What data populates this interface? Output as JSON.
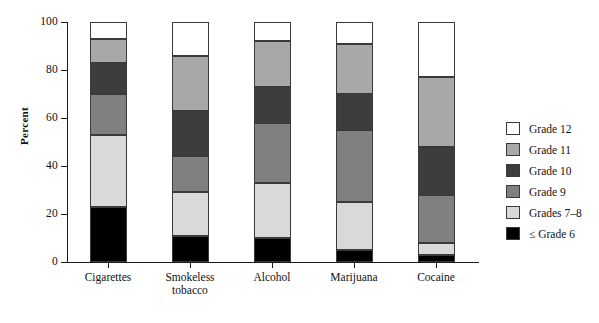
{
  "chart_data": {
    "type": "bar",
    "subtype": "stacked-bar-100",
    "title": "",
    "xlabel": "",
    "ylabel": "Percent",
    "ylim": [
      0,
      100
    ],
    "yticks": [
      0,
      20,
      40,
      60,
      80,
      100
    ],
    "ytick_labels": [
      "0",
      "20",
      "40",
      "60",
      "80",
      "100"
    ],
    "grid": false,
    "legend_position": "right",
    "categories": [
      "Cigarettes",
      "Smokeless tobacco",
      "Alcohol",
      "Marijuana",
      "Cocaine"
    ],
    "stack_order_bottom_to_top": [
      "≤ Grade 6",
      "Grades 7–8",
      "Grade 9",
      "Grade 10",
      "Grade 11",
      "Grade 12"
    ],
    "series": [
      {
        "name": "≤ Grade 6",
        "color": "#000000",
        "values": [
          23,
          11,
          10,
          5,
          3
        ]
      },
      {
        "name": "Grades 7–8",
        "color": "#d9d9d9",
        "values": [
          30,
          18,
          23,
          20,
          5
        ]
      },
      {
        "name": "Grade 9",
        "color": "#808080",
        "values": [
          17,
          15,
          25,
          30,
          20
        ]
      },
      {
        "name": "Grade 10",
        "color": "#3d3d3d",
        "values": [
          13,
          19,
          15,
          15,
          20
        ]
      },
      {
        "name": "Grade 11",
        "color": "#a8a8a8",
        "values": [
          10,
          23,
          19,
          21,
          29
        ]
      },
      {
        "name": "Grade 12",
        "color": "#ffffff",
        "values": [
          7,
          14,
          8,
          9,
          23
        ]
      }
    ],
    "cumulative_tops": {
      "Cigarettes": [
        23,
        53,
        70,
        83,
        93,
        100
      ],
      "Smokeless tobacco": [
        11,
        29,
        44,
        63,
        86,
        100
      ],
      "Alcohol": [
        10,
        33,
        58,
        73,
        92,
        100
      ],
      "Marijuana": [
        5,
        25,
        55,
        70,
        91,
        100
      ],
      "Cocaine": [
        3,
        8,
        28,
        48,
        77,
        100
      ]
    }
  },
  "legend": {
    "items": [
      {
        "label": "Grade 12",
        "color": "#ffffff"
      },
      {
        "label": "Grade 11",
        "color": "#a8a8a8"
      },
      {
        "label": "Grade 10",
        "color": "#3d3d3d"
      },
      {
        "label": "Grade 9",
        "color": "#808080"
      },
      {
        "label": "Grades 7–8",
        "color": "#d9d9d9"
      },
      {
        "label": "≤ Grade 6",
        "color": "#000000"
      }
    ]
  },
  "axis": {
    "y_title": "Percent",
    "y_labels": [
      "100",
      "80",
      "60",
      "40",
      "20",
      "0"
    ],
    "x_labels": [
      "Cigarettes",
      "Smokeless\ntobacco",
      "Alcohol",
      "Marijuana",
      "Cocaine"
    ]
  }
}
